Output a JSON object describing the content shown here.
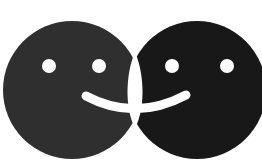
{
  "logo": {
    "name": "two overlapping smiley faces",
    "colors": {
      "background": "#ffffff",
      "left_face": "#2f2f2f",
      "right_face": "#181818",
      "features": "#ffffff"
    },
    "faces": [
      {
        "id": "left",
        "cx": 72,
        "cy": 90,
        "r": 69
      },
      {
        "id": "right",
        "cx": 197,
        "cy": 90,
        "r": 69
      }
    ]
  }
}
